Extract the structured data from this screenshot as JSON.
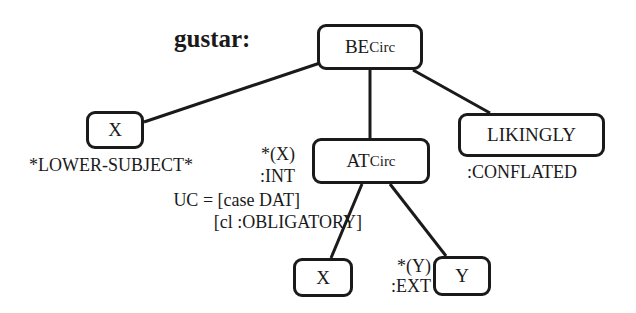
{
  "diagram": {
    "title": "gustar:",
    "nodes": {
      "be": {
        "label": "BE",
        "sub": "Circ"
      },
      "x_top": {
        "label": "X"
      },
      "at": {
        "label": "AT",
        "sub": "Circ"
      },
      "likingly": {
        "label": "LIKINGLY"
      },
      "x_bottom": {
        "label": "X"
      },
      "y": {
        "label": "Y"
      }
    },
    "annotations": {
      "lower_subject": "*LOWER-SUBJECT*",
      "at_mark": "*(X)",
      "at_int": ":INT",
      "uc_line1": "UC = [case DAT]",
      "uc_line2": "[cl :OBLIGATORY]",
      "conflated": ":CONFLATED",
      "y_mark": "*(Y)",
      "y_ext": ":EXT"
    },
    "edges": [
      {
        "from": "be",
        "to": "x_top"
      },
      {
        "from": "be",
        "to": "at"
      },
      {
        "from": "be",
        "to": "likingly"
      },
      {
        "from": "at",
        "to": "x_bottom"
      },
      {
        "from": "at",
        "to": "y"
      }
    ],
    "colors": {
      "ink": "#1a1a1a",
      "background": "#ffffff"
    }
  }
}
